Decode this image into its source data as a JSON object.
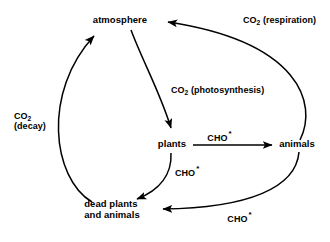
{
  "diagram": {
    "type": "cycle-diagram",
    "background_color": "#ffffff",
    "stroke_color": "#000000",
    "nodes": [
      {
        "id": "atmosphere",
        "label": "atmosphere",
        "x": 120,
        "y": 22
      },
      {
        "id": "plants",
        "label": "plants",
        "x": 172,
        "y": 145
      },
      {
        "id": "animals",
        "label": "animals",
        "x": 297,
        "y": 145
      },
      {
        "id": "dead",
        "label_line1": "dead plants",
        "label_line2": "and animals",
        "x": 112,
        "y": 205
      }
    ],
    "edges": [
      {
        "id": "decay",
        "from": "dead",
        "to": "atmosphere",
        "label_line1": "CO",
        "label_sub": "2",
        "label_line2": "(decay)"
      },
      {
        "id": "photosynthesis",
        "from": "atmosphere",
        "to": "plants",
        "label_prefix": "CO",
        "label_sub": "2",
        "label_suffix": " (photosynthesis)"
      },
      {
        "id": "respiration",
        "from": "animals",
        "to": "atmosphere",
        "label_prefix": "CO",
        "label_sub": "2",
        "label_suffix": " (respiration)"
      },
      {
        "id": "plants-to-animals",
        "from": "plants",
        "to": "animals",
        "label": "CHO",
        "label_marker": "*"
      },
      {
        "id": "plants-to-dead",
        "from": "plants",
        "to": "dead",
        "label": "CHO",
        "label_marker": "*"
      },
      {
        "id": "animals-to-dead",
        "from": "animals",
        "to": "dead",
        "label": "CHO",
        "label_marker": "*"
      }
    ]
  }
}
